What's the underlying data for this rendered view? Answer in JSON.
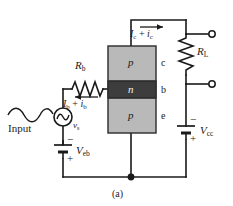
{
  "figure": {
    "caption": "(a)",
    "type": "pnp-transistor-common-base-amplifier-circuit"
  },
  "colors": {
    "wire": "#1a1a1a",
    "p_region": "#b9b9b9",
    "n_region": "#3d3d3d",
    "block_border": "#2b2b2b",
    "background": "#ffffff",
    "text": "#1a1a1a"
  },
  "transistor": {
    "collector_region_label": "p",
    "base_region_label": "n",
    "emitter_region_label": "p",
    "collector_terminal_label": "c",
    "base_terminal_label": "b",
    "emitter_terminal_label": "e"
  },
  "components": {
    "base_resistor": {
      "label": "R",
      "subscript": "b"
    },
    "load_resistor": {
      "label": "R",
      "subscript": "L"
    },
    "input_battery": {
      "label": "V",
      "subscript": "eb",
      "top_sign": "−",
      "bottom_sign": "+"
    },
    "output_battery": {
      "label": "V",
      "subscript": "cc",
      "top_sign": "−",
      "bottom_sign": "+"
    },
    "ac_source": {
      "label": "v",
      "subscript": "s",
      "symbol": "sine-wave"
    }
  },
  "currents": {
    "collector": {
      "text": "I",
      "sub1": "c",
      "plus": " + ",
      "text2": "i",
      "sub2": "c",
      "arrow_direction": "right"
    },
    "base": {
      "text": "I",
      "sub1": "b",
      "plus": " + ",
      "text2": "i",
      "sub2": "b",
      "arrow_direction": "left"
    }
  },
  "input": {
    "label": "Input",
    "waveform": "sine-squiggle"
  },
  "terminals": {
    "output_top": "open-circle",
    "output_bottom": "open-circle"
  }
}
